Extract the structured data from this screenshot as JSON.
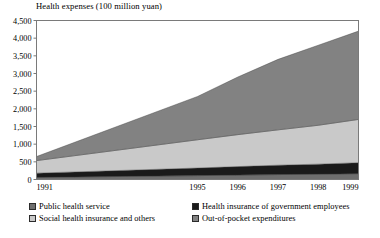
{
  "chart_data": {
    "type": "area",
    "title": "Health expenses (100 million yuan)",
    "xlabel": "",
    "ylabel": "",
    "stacked": true,
    "grid": false,
    "legend_position": "bottom",
    "categories": [
      "1991",
      "1995",
      "1996",
      "1997",
      "1998",
      "1999"
    ],
    "x_positions": [
      1991,
      1995,
      1996,
      1997,
      1998,
      1999
    ],
    "xlim": [
      1991,
      1999
    ],
    "ylim": [
      0,
      4500
    ],
    "y_ticks": [
      "0",
      "500",
      "1,000",
      "1,500",
      "2,000",
      "2,500",
      "3,000",
      "3,500",
      "4,000",
      "4,500"
    ],
    "y_tick_values": [
      0,
      500,
      1000,
      1500,
      2000,
      2500,
      3000,
      3500,
      4000,
      4500
    ],
    "series": [
      {
        "name": "Public health service",
        "color": "#6e6e6e",
        "values": [
          60,
          110,
          125,
          140,
          150,
          165
        ]
      },
      {
        "name": "Health insurance of government employees",
        "color": "#1a1a1a",
        "values": [
          120,
          215,
          240,
          265,
          285,
          310
        ]
      },
      {
        "name": "Social health insurance and others",
        "color": "#c9c9c9",
        "values": [
          355,
          800,
          905,
          1000,
          1100,
          1225
        ]
      },
      {
        "name": "Out-of-pocket expenditures",
        "color": "#828282",
        "values": [
          115,
          1225,
          1630,
          1995,
          2265,
          2500
        ]
      }
    ],
    "stack_totals": [
      650,
      2350,
      2900,
      3400,
      3800,
      4200
    ],
    "axis_color": "#7a7a7a",
    "text_color": "#000000"
  },
  "legend": {
    "entries": [
      {
        "label": "Public health service",
        "swatch": "legend-swatch-public-health"
      },
      {
        "label": "Health insurance of government employees",
        "swatch": "legend-swatch-government-employees"
      },
      {
        "label": "Social health insurance and others",
        "swatch": "legend-swatch-social-insurance"
      },
      {
        "label": "Out-of-pocket expenditures",
        "swatch": "legend-swatch-out-of-pocket"
      }
    ]
  }
}
